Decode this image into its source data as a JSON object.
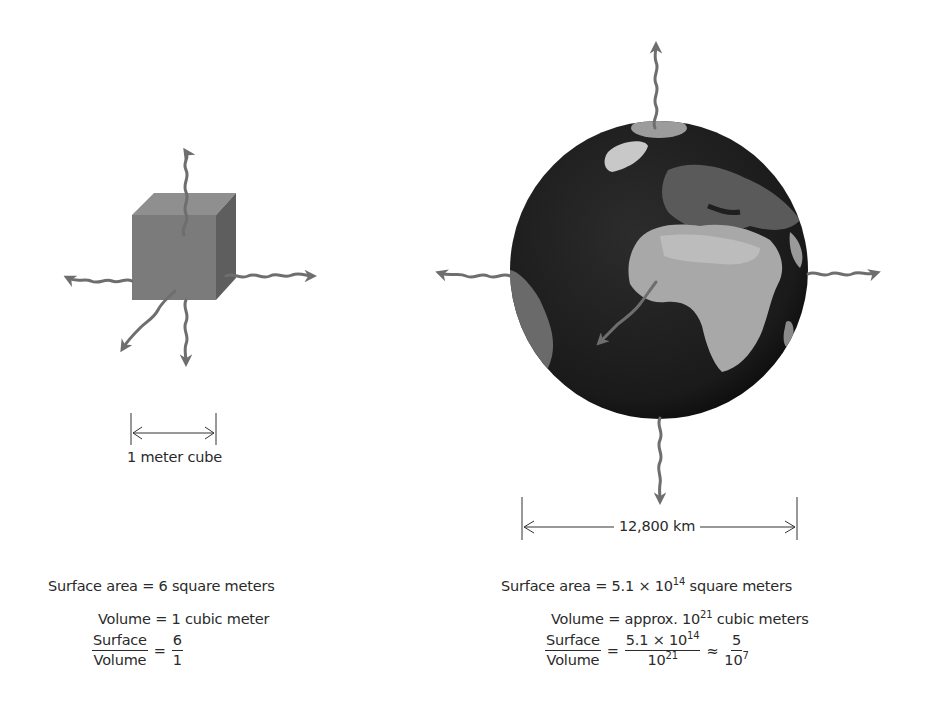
{
  "cube": {
    "dimension_label": "1 meter cube",
    "surface_line": "Surface area = 6 square meters",
    "volume_line": "Volume = 1 cubic meter",
    "ratio": {
      "numerator_label": "Surface",
      "denominator_label": "Volume",
      "equals": "=",
      "value_num": "6",
      "value_den": "1"
    }
  },
  "earth": {
    "dimension_label": "12,800 km",
    "surface_prefix": "Surface area = 5.1 × 10",
    "surface_exp": "14",
    "surface_suffix": " square meters",
    "volume_prefix": "Volume = approx. 10",
    "volume_exp": "21",
    "volume_suffix": " cubic meters",
    "ratio": {
      "numerator_label": "Surface",
      "denominator_label": "Volume",
      "equals": "=",
      "mid_num_prefix": "5.1 × 10",
      "mid_num_exp": "14",
      "mid_den_prefix": "10",
      "mid_den_exp": "21",
      "approx": "≈",
      "final_num": "5",
      "final_den_prefix": "10",
      "final_den_exp": "7"
    }
  },
  "colors": {
    "arrow": "#6e6e6e",
    "cube_front": "#7b7b7b",
    "cube_top": "#8f8f8f",
    "cube_side": "#5e5e5e",
    "ocean": "#1f1f1f",
    "land": "#a8a8a8"
  }
}
